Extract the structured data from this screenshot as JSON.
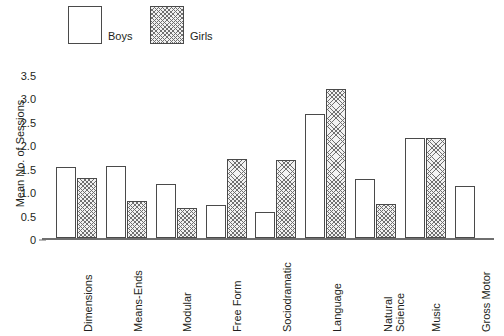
{
  "chart_data": {
    "type": "bar",
    "title": "",
    "xlabel": "",
    "ylabel": "Mean No. of Sessions",
    "ylim": [
      0,
      3.5
    ],
    "ytick_labels": [
      "0",
      "0.5",
      "1.0",
      "1.5",
      "2.0",
      "2.5",
      "3.0",
      "3.5"
    ],
    "ytick_values": [
      0,
      0.5,
      1.0,
      1.5,
      2.0,
      2.5,
      3.0,
      3.5
    ],
    "grid": false,
    "legend_position": "top-left",
    "categories": [
      "Dimensions",
      "Means-Ends",
      "Modular",
      "Free Form",
      "Sociodramatic",
      "Language",
      "Natural Science",
      "Music",
      "Gross Motor"
    ],
    "series": [
      {
        "name": "Boys",
        "fill": "white",
        "values": [
          1.52,
          1.53,
          1.15,
          0.7,
          0.55,
          2.65,
          1.25,
          2.13,
          1.1
        ]
      },
      {
        "name": "Girls",
        "fill": "hatched",
        "values": [
          1.28,
          0.8,
          0.65,
          1.68,
          1.67,
          3.17,
          0.73,
          2.13,
          null
        ]
      }
    ]
  },
  "legend": {
    "boys_label": "Boys",
    "girls_label": "Girls"
  },
  "x_label_lines": [
    [
      "Dimensions"
    ],
    [
      "Means-Ends"
    ],
    [
      "Modular"
    ],
    [
      "Free Form"
    ],
    [
      "Sociodramatic"
    ],
    [
      "Language"
    ],
    [
      "Natural",
      "Science"
    ],
    [
      "Music"
    ],
    [
      "Gross Motor"
    ]
  ],
  "colors": {
    "line": "#4a4a4a",
    "axis": "#6f6f6f",
    "text": "#231f20",
    "bar_fill_boys": "#ffffff",
    "bar_fill_girls": "#f2f2f2"
  }
}
